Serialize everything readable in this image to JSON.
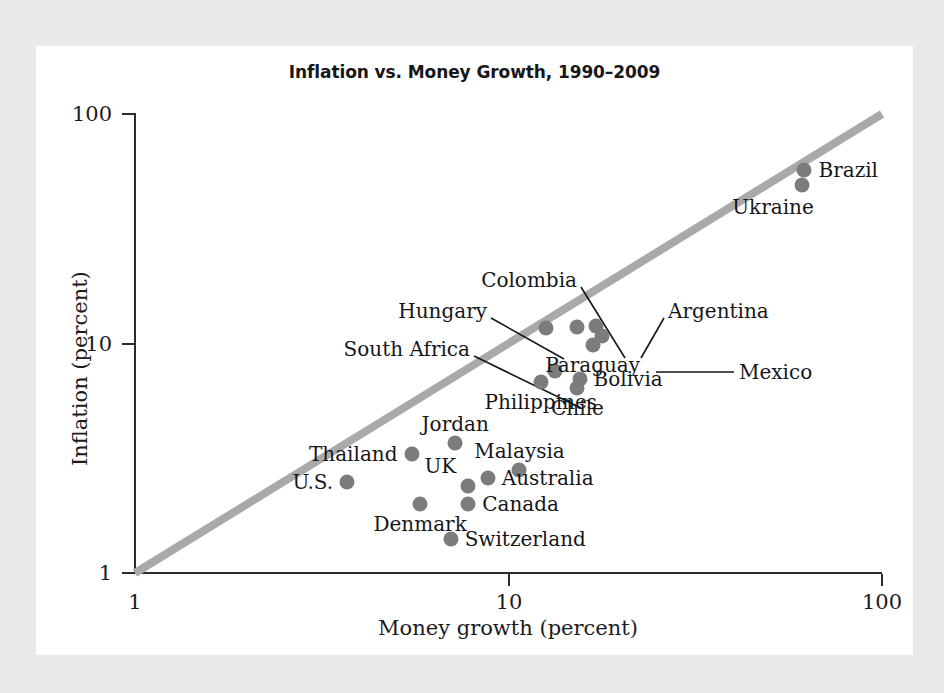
{
  "chart_data": {
    "type": "scatter",
    "title": "Inflation vs. Money Growth, 1990–2009",
    "xlabel": "Money growth (percent)",
    "ylabel": "Inflation (percent)",
    "xscale": "log",
    "yscale": "log",
    "xlim": [
      1,
      100
    ],
    "ylim": [
      1,
      100
    ],
    "xticks": [
      "1",
      "10",
      "100"
    ],
    "yticks": [
      "1",
      "10",
      "100"
    ],
    "grid": false,
    "legend": "none",
    "reference_line": {
      "name": "45-degree line",
      "description": "Diagonal line where inflation equals money growth",
      "from": [
        1,
        1
      ],
      "to": [
        100,
        100
      ],
      "color": "#a9a9a9"
    },
    "point_color": "#7c7c7c",
    "points": [
      {
        "label": "Brazil",
        "x": 62.0,
        "y": 57.0,
        "label_pos": "right"
      },
      {
        "label": "Ukraine",
        "x": 61.0,
        "y": 49.0,
        "label_pos": "left-below"
      },
      {
        "label": "Argentina",
        "x": 17.2,
        "y": 11.9,
        "label_pos": "leader"
      },
      {
        "label": "Mexico",
        "x": 17.8,
        "y": 10.8,
        "label_pos": "leader"
      },
      {
        "label": "Paraguay",
        "x": 16.8,
        "y": 9.9,
        "label_pos": "below"
      },
      {
        "label": "Colombia",
        "x": 15.3,
        "y": 11.8,
        "label_pos": "leader"
      },
      {
        "label": "Hungary",
        "x": 12.6,
        "y": 11.7,
        "label_pos": "leader"
      },
      {
        "label": "Bolivia",
        "x": 15.5,
        "y": 7.0,
        "label_pos": "right"
      },
      {
        "label": "Chile",
        "x": 15.3,
        "y": 6.4,
        "label_pos": "below"
      },
      {
        "label": "South Africa",
        "x": 13.3,
        "y": 7.6,
        "label_pos": "leader"
      },
      {
        "label": "Philippines",
        "x": 12.2,
        "y": 6.8,
        "label_pos": "below"
      },
      {
        "label": "Jordan",
        "x": 7.2,
        "y": 3.7,
        "label_pos": "above"
      },
      {
        "label": "Thailand",
        "x": 5.5,
        "y": 3.3,
        "label_pos": "left"
      },
      {
        "label": "Malaysia",
        "x": 10.7,
        "y": 2.8,
        "label_pos": "above"
      },
      {
        "label": "U.S.",
        "x": 3.7,
        "y": 2.5,
        "label_pos": "left"
      },
      {
        "label": "Australia",
        "x": 8.8,
        "y": 2.6,
        "label_pos": "right"
      },
      {
        "label": "UK",
        "x": 7.8,
        "y": 2.4,
        "label_pos": "above-left"
      },
      {
        "label": "Canada",
        "x": 7.8,
        "y": 2.0,
        "label_pos": "right"
      },
      {
        "label": "Denmark",
        "x": 5.8,
        "y": 2.0,
        "label_pos": "below"
      },
      {
        "label": "Switzerland",
        "x": 7.0,
        "y": 1.4,
        "label_pos": "right"
      }
    ]
  }
}
